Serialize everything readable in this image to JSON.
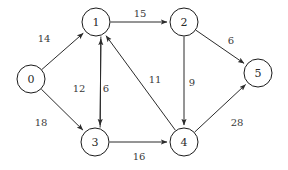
{
  "figure": {
    "type": "directed-weighted-graph",
    "background": "#ffffff",
    "node_stroke": "#1a1a1a",
    "edge_stroke": "#2b2b2b",
    "label_color": "#3a3a3a"
  },
  "chart_data": {
    "type": "diagram",
    "title": "",
    "directed": true,
    "weighted": true,
    "nodes": [
      {
        "id": "0",
        "label": "0",
        "x": 31,
        "y": 79,
        "r": 14
      },
      {
        "id": "1",
        "label": "1",
        "x": 96,
        "y": 22,
        "r": 14
      },
      {
        "id": "2",
        "label": "2",
        "x": 184,
        "y": 22,
        "r": 14
      },
      {
        "id": "3",
        "label": "3",
        "x": 95,
        "y": 142,
        "r": 14
      },
      {
        "id": "4",
        "label": "4",
        "x": 184,
        "y": 142,
        "r": 14
      },
      {
        "id": "5",
        "label": "5",
        "x": 258,
        "y": 73,
        "r": 14
      }
    ],
    "edges": [
      {
        "from": "0",
        "to": "1",
        "weight": "14",
        "label_x": 44,
        "label_y": 38
      },
      {
        "from": "0",
        "to": "3",
        "weight": "18",
        "label_x": 41,
        "label_y": 122
      },
      {
        "from": "1",
        "to": "2",
        "weight": "15",
        "label_x": 140,
        "label_y": 13
      },
      {
        "from": "1",
        "to": "3",
        "weight": "12",
        "label_x": 79,
        "label_y": 88
      },
      {
        "from": "3",
        "to": "1",
        "weight": "6",
        "label_x": 106,
        "label_y": 88
      },
      {
        "from": "2",
        "to": "4",
        "weight": "9",
        "label_x": 192,
        "label_y": 82
      },
      {
        "from": "2",
        "to": "5",
        "weight": "6",
        "label_x": 231,
        "label_y": 40
      },
      {
        "from": "3",
        "to": "4",
        "weight": "16",
        "label_x": 139,
        "label_y": 156
      },
      {
        "from": "4",
        "to": "1",
        "weight": "11",
        "label_x": 155,
        "label_y": 79
      },
      {
        "from": "4",
        "to": "5",
        "weight": "28",
        "label_x": 237,
        "label_y": 122
      }
    ]
  }
}
